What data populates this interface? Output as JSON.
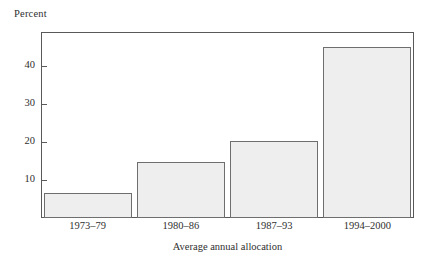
{
  "chart_data": {
    "type": "bar",
    "title": "",
    "subtitle": "",
    "xlabel": "Average annual allocation",
    "ylabel": "Percent",
    "categories": [
      "1973–79",
      "1980–86",
      "1987–93",
      "1994–2000"
    ],
    "values": [
      6.5,
      14.8,
      20.4,
      45
    ],
    "ylim": [
      0,
      49
    ],
    "yticks": [
      10,
      20,
      30,
      40
    ],
    "ytick_labels": [
      "10",
      "20",
      "30",
      "40"
    ],
    "grid": false,
    "legend": null,
    "series": [
      {
        "name": "Average annual allocation",
        "values": [
          6.5,
          14.8,
          20.4,
          45
        ]
      }
    ],
    "bar_fill_color": "#eeeeee",
    "bar_border_color": "#6e6e6e",
    "axis_color": "#595959"
  },
  "axes": {
    "y_caption": "Percent",
    "x_caption": "Average annual allocation"
  }
}
